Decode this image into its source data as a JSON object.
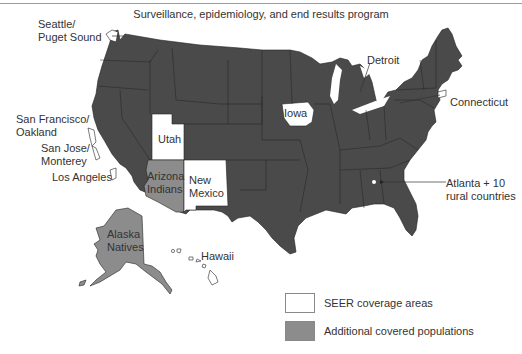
{
  "title": "Surveillance, epidemiology, and end results program",
  "colors": {
    "non_covered": "#4a4a4a",
    "seer_coverage": "#ffffff",
    "additional_covered": "#8c8c8c",
    "border": "#222222"
  },
  "map_labels": {
    "seattle": "Seattle/\nPuget Sound",
    "seattle_l1": "Seattle/",
    "seattle_l2": "Puget Sound",
    "sf_l1": "San Francisco/",
    "sf_l2": "Oakland",
    "sj_l1": "San Jose/",
    "sj_l2": "Monterey",
    "la": "Los Angeles",
    "utah": "Utah",
    "az_l1": "Arizona",
    "az_l2": "Indians",
    "nm_l1": "New",
    "nm_l2": "Mexico",
    "iowa": "Iowa",
    "detroit": "Detroit",
    "connecticut": "Connecticut",
    "atlanta_l1": "Atlanta + 10",
    "atlanta_l2": "rural countries",
    "ak_l1": "Alaska",
    "ak_l2": "Natives",
    "hawaii": "Hawaii"
  },
  "legend": [
    {
      "label": "SEER coverage areas",
      "color": "#ffffff"
    },
    {
      "label": "Additional covered populations",
      "color": "#8c8c8c"
    }
  ]
}
